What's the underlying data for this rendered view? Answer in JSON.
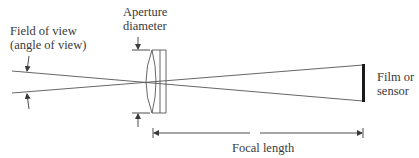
{
  "diagram": {
    "labels": {
      "field_of_view_line1": "Field of view",
      "field_of_view_line2": "(angle of view)",
      "aperture_line1": "Aperture",
      "aperture_line2": "diameter",
      "sensor_line1": "Film or",
      "sensor_line2": "sensor",
      "focal_length": "Focal length"
    },
    "colors": {
      "line": "#3a3a3a",
      "sensor": "#1a1a1a",
      "background": "#ffffff"
    },
    "elements": [
      "rays",
      "lens",
      "sensor",
      "field-of-view-arrows",
      "aperture-arrows",
      "focal-length-dimension"
    ]
  }
}
